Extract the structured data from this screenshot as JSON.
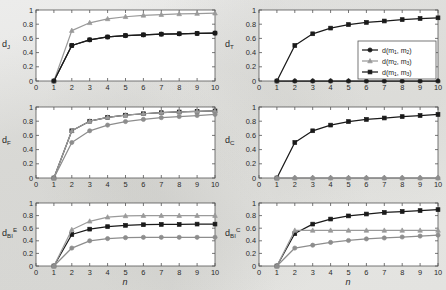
{
  "figure": {
    "background_color": "#e8e8e6",
    "panel_background": "#ffffff",
    "axis_color": "#555555",
    "xlabel": "n",
    "x_ticks": [
      "0",
      "1",
      "2",
      "3",
      "4",
      "5",
      "6",
      "7",
      "8",
      "9",
      "10"
    ],
    "y_ticks": [
      "0",
      "0.2",
      "0.4",
      "0.6",
      "0.8",
      "1"
    ],
    "xlim": [
      0,
      10
    ],
    "ylim": [
      0,
      1
    ]
  },
  "legend": {
    "position": "top-right panel, lower-right inside axes",
    "entries": [
      {
        "label": "d(m1, m2)",
        "color": "#1a1a1a",
        "marker": "circle"
      },
      {
        "label": "d(m2, m3)",
        "color": "#9a9a9a",
        "marker": "triangle"
      },
      {
        "label": "d(m1, m3)",
        "color": "#1a1a1a",
        "marker": "square"
      }
    ]
  },
  "chart_data": [
    {
      "type": "line",
      "panel": "top-left",
      "title": "",
      "ylabel": "d_J",
      "ylabel_base": "d",
      "ylabel_sub": "J",
      "ylabel_sup": "",
      "xlabel": "",
      "x": [
        1,
        2,
        3,
        4,
        5,
        6,
        7,
        8,
        9,
        10
      ],
      "xlim": [
        0,
        10
      ],
      "ylim": [
        0,
        1
      ],
      "grid": false,
      "series": [
        {
          "name": "d(m1, m2)",
          "color": "#1a1a1a",
          "marker": "circle",
          "values": [
            0.0,
            0.5,
            0.58,
            0.62,
            0.64,
            0.65,
            0.66,
            0.665,
            0.67,
            0.675
          ]
        },
        {
          "name": "d(m2, m3)",
          "color": "#9a9a9a",
          "marker": "triangle",
          "values": [
            0.0,
            0.71,
            0.82,
            0.875,
            0.905,
            0.925,
            0.935,
            0.945,
            0.95,
            0.955
          ]
        },
        {
          "name": "d(m1, m3)",
          "color": "#1a1a1a",
          "marker": "square",
          "values": [
            0.0,
            0.5,
            0.58,
            0.62,
            0.64,
            0.65,
            0.66,
            0.665,
            0.67,
            0.675
          ]
        }
      ]
    },
    {
      "type": "line",
      "panel": "top-right",
      "ylabel": "d_T",
      "ylabel_base": "d",
      "ylabel_sub": "T",
      "ylabel_sup": "",
      "xlabel": "",
      "x": [
        1,
        2,
        3,
        4,
        5,
        6,
        7,
        8,
        9,
        10
      ],
      "xlim": [
        0,
        10
      ],
      "ylim": [
        0,
        1
      ],
      "grid": false,
      "has_legend": true,
      "series": [
        {
          "name": "d(m1, m2)",
          "color": "#1a1a1a",
          "marker": "circle",
          "values": [
            0.0,
            0.0,
            0.0,
            0.0,
            0.0,
            0.0,
            0.0,
            0.0,
            0.0,
            0.0
          ]
        },
        {
          "name": "d(m2, m3)",
          "color": "#9a9a9a",
          "marker": "triangle",
          "values": [
            0.0,
            0.0,
            0.0,
            0.0,
            0.0,
            0.0,
            0.0,
            0.0,
            0.0,
            0.0
          ]
        },
        {
          "name": "d(m1, m3)",
          "color": "#1a1a1a",
          "marker": "square",
          "values": [
            0.0,
            0.5,
            0.665,
            0.745,
            0.795,
            0.825,
            0.845,
            0.865,
            0.88,
            0.89
          ]
        }
      ]
    },
    {
      "type": "line",
      "panel": "middle-left",
      "ylabel": "d_F",
      "ylabel_base": "d",
      "ylabel_sub": "F",
      "ylabel_sup": "",
      "xlabel": "",
      "x": [
        1,
        2,
        3,
        4,
        5,
        6,
        7,
        8,
        9,
        10
      ],
      "xlim": [
        0,
        10
      ],
      "ylim": [
        0,
        1
      ],
      "grid": false,
      "series": [
        {
          "name": "d(m1, m2)",
          "color": "#8d8d8d",
          "marker": "circle",
          "values": [
            0.0,
            0.5,
            0.665,
            0.745,
            0.795,
            0.825,
            0.85,
            0.865,
            0.88,
            0.895
          ]
        },
        {
          "name": "d(m2, m3)",
          "color": "#9a9a9a",
          "marker": "triangle",
          "values": [
            0.0,
            0.665,
            0.8,
            0.855,
            0.885,
            0.905,
            0.92,
            0.93,
            0.94,
            0.945
          ]
        },
        {
          "name": "d(m1, m3)",
          "color": "#1a1a1a",
          "marker": "square",
          "values": [
            0.0,
            0.665,
            0.8,
            0.855,
            0.885,
            0.905,
            0.92,
            0.93,
            0.94,
            0.945
          ]
        }
      ]
    },
    {
      "type": "line",
      "panel": "middle-right",
      "ylabel": "d_C",
      "ylabel_base": "d",
      "ylabel_sub": "C",
      "ylabel_sup": "",
      "xlabel": "",
      "x": [
        1,
        2,
        3,
        4,
        5,
        6,
        7,
        8,
        9,
        10
      ],
      "xlim": [
        0,
        10
      ],
      "ylim": [
        0,
        1
      ],
      "grid": false,
      "series": [
        {
          "name": "d(m1, m2)",
          "color": "#8d8d8d",
          "marker": "circle",
          "values": [
            0.0,
            0.0,
            0.0,
            0.0,
            0.0,
            0.0,
            0.0,
            0.0,
            0.0,
            0.0
          ]
        },
        {
          "name": "d(m2, m3)",
          "color": "#9a9a9a",
          "marker": "triangle",
          "values": [
            0.0,
            0.0,
            0.0,
            0.0,
            0.0,
            0.0,
            0.0,
            0.0,
            0.0,
            0.0
          ]
        },
        {
          "name": "d(m1, m3)",
          "color": "#1a1a1a",
          "marker": "square",
          "values": [
            0.0,
            0.5,
            0.665,
            0.745,
            0.795,
            0.825,
            0.845,
            0.865,
            0.88,
            0.895
          ]
        }
      ]
    },
    {
      "type": "line",
      "panel": "bottom-left",
      "ylabel": "d_BI^E",
      "ylabel_base": "d",
      "ylabel_sub": "BI",
      "ylabel_sup": "E",
      "xlabel": "n",
      "x": [
        1,
        2,
        3,
        4,
        5,
        6,
        7,
        8,
        9,
        10
      ],
      "xlim": [
        0,
        10
      ],
      "ylim": [
        0,
        1
      ],
      "grid": false,
      "series": [
        {
          "name": "d(m1, m2)",
          "color": "#8d8d8d",
          "marker": "circle",
          "values": [
            0.0,
            0.285,
            0.4,
            0.435,
            0.45,
            0.455,
            0.455,
            0.455,
            0.455,
            0.455
          ]
        },
        {
          "name": "d(m2, m3)",
          "color": "#9a9a9a",
          "marker": "triangle",
          "values": [
            0.0,
            0.575,
            0.71,
            0.775,
            0.795,
            0.8,
            0.8,
            0.8,
            0.8,
            0.8
          ]
        },
        {
          "name": "d(m1, m3)",
          "color": "#1a1a1a",
          "marker": "square",
          "values": [
            0.0,
            0.5,
            0.585,
            0.625,
            0.645,
            0.655,
            0.66,
            0.66,
            0.665,
            0.665
          ]
        }
      ]
    },
    {
      "type": "line",
      "panel": "bottom-right",
      "ylabel": "d_BI^C",
      "ylabel_base": "d",
      "ylabel_sub": "BI",
      "ylabel_sup": "C",
      "xlabel": "n",
      "x": [
        1,
        2,
        3,
        4,
        5,
        6,
        7,
        8,
        9,
        10
      ],
      "xlim": [
        0,
        10
      ],
      "ylim": [
        0,
        1
      ],
      "grid": false,
      "series": [
        {
          "name": "d(m1, m2)",
          "color": "#8d8d8d",
          "marker": "circle",
          "values": [
            0.0,
            0.285,
            0.33,
            0.375,
            0.405,
            0.43,
            0.445,
            0.46,
            0.475,
            0.49
          ]
        },
        {
          "name": "d(m2, m3)",
          "color": "#9a9a9a",
          "marker": "triangle",
          "values": [
            0.0,
            0.565,
            0.565,
            0.565,
            0.565,
            0.565,
            0.565,
            0.565,
            0.565,
            0.565
          ]
        },
        {
          "name": "d(m1, m3)",
          "color": "#1a1a1a",
          "marker": "square",
          "values": [
            0.0,
            0.515,
            0.665,
            0.745,
            0.795,
            0.825,
            0.85,
            0.865,
            0.88,
            0.895
          ]
        }
      ]
    }
  ]
}
